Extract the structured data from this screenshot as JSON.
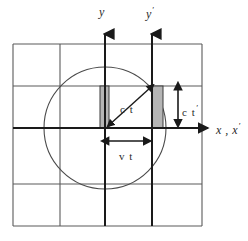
{
  "figure": {
    "background_color": "#ffffff",
    "grid_color": "#5a5a5a",
    "axis_color": "#1a1a1a",
    "circle_color": "#4a4a4a",
    "shade_fill": "#b5b5b5",
    "shade_stroke": "#3a3a3a",
    "text_color": "#2a2a2a"
  },
  "labels": {
    "y_axis": "y",
    "y_prime_axis": "y",
    "y_prime_mark": "′",
    "x_axis": "x , x",
    "x_prime_mark": "′",
    "ct": "c t",
    "ct_prime": "c t",
    "ct_prime_mark": "′",
    "vt": "v t"
  },
  "geometry": {
    "origin_x": 105,
    "origin_y": 128,
    "y_axis_x": 105,
    "y_prime_axis_x": 152,
    "circle_radius": 61,
    "grid_vertical_x": [
      13,
      60,
      105,
      152,
      202
    ],
    "grid_horizontal_y": [
      44,
      86,
      128,
      184,
      226
    ],
    "shade_left": {
      "x": 100,
      "y": 86,
      "w": 9,
      "h": 42
    },
    "shade_right": {
      "x": 152,
      "y": 86,
      "w": 11,
      "h": 42
    },
    "vt_arrow": {
      "x1": 105,
      "x2": 152,
      "y": 141
    },
    "ct_prime_arrow": {
      "x": 178,
      "y1": 86,
      "y2": 128
    },
    "ct_arrow": {
      "x1": 105,
      "y1": 128,
      "x2": 152,
      "y2": 86
    }
  }
}
